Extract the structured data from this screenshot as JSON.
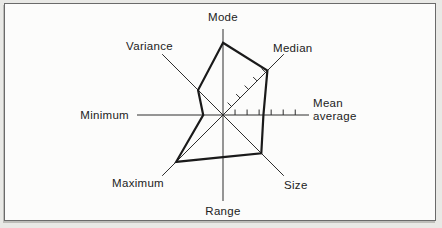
{
  "figure": {
    "title": "",
    "description_visible_text_only": ""
  },
  "chart_data": {
    "type": "radar",
    "title": "",
    "axes": [
      "Mode",
      "Median",
      "Mean average",
      "Size",
      "Range",
      "Maximum",
      "Minimum",
      "Variance"
    ],
    "axis_label_lines": {
      "Mean average": [
        "Mean",
        "average"
      ]
    },
    "angles_deg": [
      90,
      45,
      0,
      -45,
      -90,
      -135,
      180,
      135
    ],
    "series": [
      {
        "name": "profile-polygon",
        "values_fraction_of_axis": [
          0.84,
          0.73,
          0.47,
          0.63,
          0.49,
          0.77,
          0.23,
          0.41
        ]
      }
    ],
    "ticked_axes": [
      {
        "axis": "Median",
        "tick_count": 5
      },
      {
        "axis": "Mean average",
        "tick_count": 6
      }
    ],
    "tick_spacing_fraction": 0.14,
    "grid": false,
    "legend": null,
    "axis_range": [
      0,
      1
    ],
    "colors": {
      "polygon": "#1a1a1a",
      "axis_line": "#2e2e2e",
      "tick": "#2e2e2e",
      "label_text": "#222222",
      "panel_background": "#fcfcfb",
      "panel_border": "#6a6a6a"
    }
  }
}
